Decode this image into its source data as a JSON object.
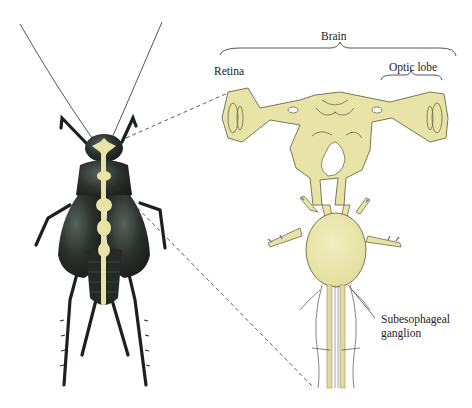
{
  "labels": {
    "brain": "Brain",
    "retina": "Retina",
    "optic_lobe": "Optic lobe",
    "subesophageal_line1": "Subesophageal",
    "subesophageal_line2": "ganglion"
  },
  "colors": {
    "nerve_tissue": "#e8e4a8",
    "nerve_outline": "#6b6a45",
    "insect_body": "#1e2320",
    "insect_highlight": "#4b5650",
    "leader_line": "#333333"
  }
}
